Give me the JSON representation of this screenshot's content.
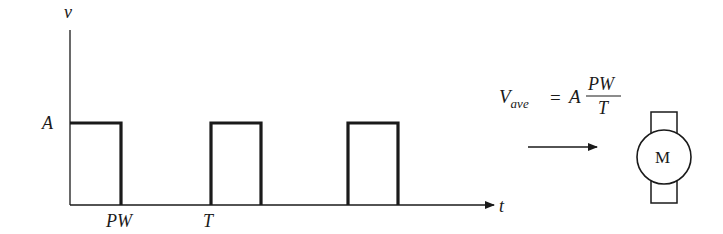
{
  "waveform": {
    "y_axis_label": "v",
    "x_axis_label": "t",
    "amplitude_label": "A",
    "pulse_width_label": "PW",
    "period_label": "T",
    "pulses": [
      {
        "start": 0,
        "end": "PW"
      },
      {
        "start": "T",
        "end": "T+PW"
      },
      {
        "start": "2T",
        "end": "2T+PW"
      }
    ]
  },
  "equation": {
    "lhs_symbol": "V",
    "lhs_subscript": "ave",
    "equals": "=",
    "coefficient": "A",
    "numerator": "PW",
    "denominator": "T"
  },
  "motor": {
    "label": "M"
  },
  "colors": {
    "line": "#1a1a1a",
    "background": "#ffffff"
  }
}
